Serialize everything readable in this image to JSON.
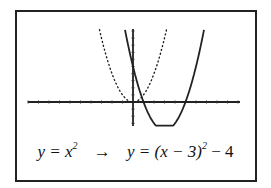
{
  "chart_data": {
    "type": "line",
    "title": "",
    "xlabel": "",
    "ylabel": "",
    "xlim": [
      -10,
      10
    ],
    "ylim": [
      -3,
      10
    ],
    "x_tick_step": 1,
    "y_tick_step": 1,
    "grid": false,
    "series": [
      {
        "name": "y = x^2",
        "style": "dotted",
        "function": "x^2",
        "vertex": [
          0,
          0
        ]
      },
      {
        "name": "y = (x-3)^2 - 4",
        "style": "solid",
        "function": "(x-3)^2 - 4",
        "vertex": [
          3,
          -4
        ]
      }
    ]
  },
  "caption": {
    "left_prefix": "y = x",
    "left_exp": "2",
    "arrow": "→",
    "right_prefix": "y = (x − 3)",
    "right_exp": "2",
    "right_suffix": " − 4"
  },
  "layout": {
    "origin_px": [
      133,
      102
    ],
    "px_per_x": 10.5,
    "px_per_y": 7.1,
    "x_axis_px": [
      28,
      240
    ],
    "y_axis_px": [
      29,
      126
    ],
    "plot_top_px": 28
  }
}
